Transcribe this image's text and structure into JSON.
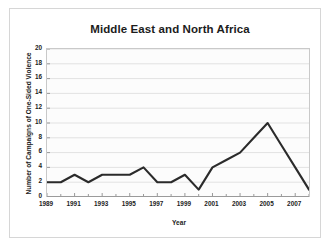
{
  "chart_data": {
    "type": "line",
    "title": "Middle East and North Africa",
    "xlabel": "Year",
    "ylabel": "Number of Campaigns of One-Sided Violence",
    "x": [
      1989,
      1990,
      1991,
      1992,
      1993,
      1994,
      1995,
      1996,
      1997,
      1998,
      1999,
      2000,
      2001,
      2002,
      2003,
      2004,
      2005,
      2006,
      2007,
      2008
    ],
    "values": [
      2,
      2,
      3,
      2,
      3,
      3,
      3,
      4,
      2,
      2,
      3,
      1,
      4,
      5,
      6,
      8,
      10,
      7,
      4,
      1
    ],
    "xlim": [
      1989,
      2008
    ],
    "ylim": [
      0,
      20
    ],
    "ytick_labels": [
      "0",
      "2",
      "4",
      "6",
      "8",
      "10",
      "12",
      "14",
      "16",
      "18",
      "20"
    ],
    "ytick_values": [
      0,
      2,
      4,
      6,
      8,
      10,
      12,
      14,
      16,
      18,
      20
    ],
    "xtick_labels": [
      "1989",
      "1991",
      "1993",
      "1995",
      "1997",
      "1999",
      "2001",
      "2003",
      "2005",
      "2007"
    ],
    "xtick_values": [
      1989,
      1991,
      1993,
      1995,
      1997,
      1999,
      2001,
      2003,
      2005,
      2007
    ],
    "xtick_minor_values": [
      1990,
      1992,
      1994,
      1996,
      1998,
      2000,
      2002,
      2004,
      2006,
      2008
    ],
    "grid": "horizontal",
    "legend": "none",
    "line_color": "#2b2b2b",
    "grid_color": "#e2e2e2",
    "axis_color": "#9a9a9a",
    "plot_background": "#fcfcfc",
    "figure_background": "#ffffff",
    "text_color": "#1c1c1c"
  }
}
